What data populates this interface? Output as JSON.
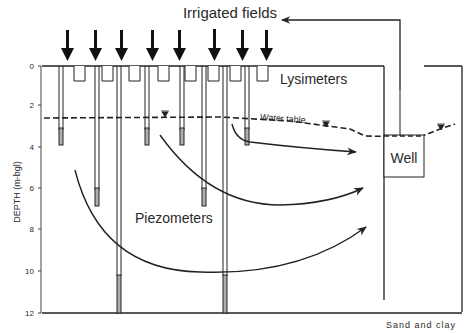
{
  "title": "Irrigated fields",
  "labels": {
    "lysimeters": "Lysimeters",
    "water_table": "Water table",
    "well": "Well",
    "piezometers": "Piezometers",
    "sand_clay": "Sand and clay",
    "y_axis": "DEPTH (m-bgl)"
  },
  "y_axis": {
    "ticks": [
      {
        "label": "0",
        "y": 66
      },
      {
        "label": "2",
        "y": 105
      },
      {
        "label": "4",
        "y": 147
      },
      {
        "label": "6",
        "y": 188
      },
      {
        "label": "8",
        "y": 229
      },
      {
        "label": "10",
        "y": 271
      },
      {
        "label": "12",
        "y": 313
      }
    ]
  },
  "colors": {
    "ink": "#222222",
    "background": "#ffffff"
  }
}
